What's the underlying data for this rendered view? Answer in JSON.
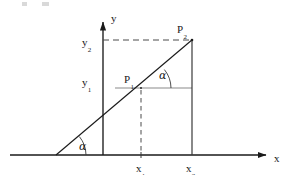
{
  "figure": {
    "kind": "slope-triangle-diagram",
    "background_color": "#ffffff",
    "line_color": "#1a1a1a",
    "guide_color": "#7d7d7d",
    "width": 290,
    "height": 175
  },
  "axes": {
    "x_axis_label": "x",
    "y_axis_label": "y",
    "x_axis_y_px": 155,
    "y_axis_x_px": 103,
    "x_axis_start_px": 10,
    "x_axis_end_px": 268,
    "y_axis_top_px": 20
  },
  "points": [
    {
      "name": "P1",
      "base": "P",
      "sub": "1",
      "x_px": 141,
      "y_px": 88,
      "label_left_px": 124,
      "label_top_px": 70
    },
    {
      "name": "P2",
      "base": "P",
      "sub": "2",
      "x_px": 192,
      "y_px": 40,
      "label_left_px": 177,
      "label_top_px": 20
    }
  ],
  "tick_labels": [
    {
      "name": "x1",
      "base": "x",
      "sub": "1",
      "left_px": 136,
      "top_px": 159
    },
    {
      "name": "x2",
      "base": "x",
      "sub": "2",
      "left_px": 186,
      "top_px": 159
    },
    {
      "name": "y1",
      "base": "y",
      "sub": "1",
      "left_px": 82,
      "top_px": 73
    },
    {
      "name": "y2",
      "base": "y",
      "sub": "2",
      "left_px": 82,
      "top_px": 33
    }
  ],
  "angles": [
    {
      "name": "alpha-origin",
      "symbol": "α",
      "vertex_x_px": 56,
      "vertex_y_px": 155,
      "label_left_px": 79,
      "label_top_px": 137
    },
    {
      "name": "alpha-at-p1",
      "symbol": "α",
      "vertex_x_px": 141,
      "vertex_y_px": 88,
      "label_left_px": 159,
      "label_top_px": 66
    }
  ],
  "segments": {
    "slant_line": {
      "from_x_px": 56,
      "from_y_px": 155,
      "to_x_px": 192,
      "to_y_px": 40
    },
    "dashed_horizontal_y2": {
      "from_x_px": 103,
      "to_x_px": 192,
      "y_px": 40
    },
    "dashed_vertical_x1": {
      "x_px": 141,
      "from_y_px": 88,
      "to_y_px": 152
    },
    "solid_vertical_x2": {
      "x_px": 192,
      "from_y_px": 40,
      "to_y_px": 155
    },
    "guide_horizontal_p1": {
      "from_x_px": 115,
      "to_x_px": 192,
      "y_px": 88
    }
  }
}
